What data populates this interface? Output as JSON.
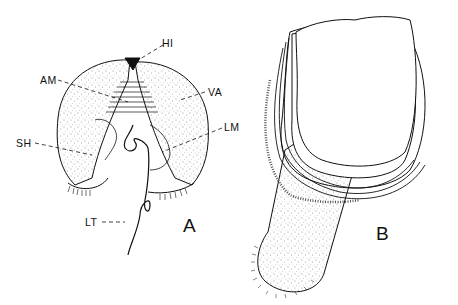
{
  "figure": {
    "panels": [
      {
        "id": "A",
        "label": "A",
        "description": "bivalve shell, valves open, lophophore extended"
      },
      {
        "id": "B",
        "label": "B",
        "description": "shell with pedicle (stalk)"
      }
    ],
    "labels": {
      "hi": "HI",
      "am": "AM",
      "va": "VA",
      "sh": "SH",
      "lm": "LM",
      "lt": "LT"
    },
    "colors": {
      "ink": "#111111",
      "background": "#ffffff"
    }
  }
}
